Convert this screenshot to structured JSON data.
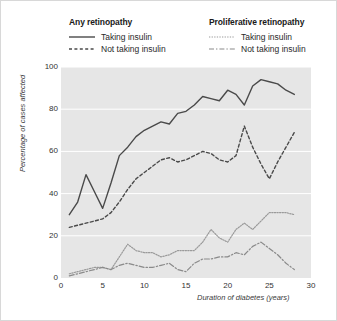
{
  "figure": {
    "background_color": "#ffffff",
    "plot_background_color": "#e6e6e6",
    "grid_color": "#ffffff",
    "border_color": "#d8d8d8"
  },
  "legend": {
    "groups": [
      {
        "title": "Any retinopathy",
        "entries": [
          {
            "label": "Taking insulin",
            "style": "solid",
            "color": "#4a4a4a"
          },
          {
            "label": "Not taking insulin",
            "style": "dashed",
            "color": "#4a4a4a"
          }
        ]
      },
      {
        "title": "Proliferative retinopathy",
        "entries": [
          {
            "label": "Taking insulin",
            "style": "dotted",
            "color": "#9a9a9a"
          },
          {
            "label": "Not taking insulin",
            "style": "dashdot",
            "color": "#8a8a8a"
          }
        ]
      }
    ]
  },
  "chart_data": {
    "type": "line",
    "title": "",
    "xlabel": "Duration of diabetes (years)",
    "ylabel": "Percentage of cases affected",
    "xlim": [
      0,
      30
    ],
    "ylim": [
      0,
      100
    ],
    "xticks": [
      0,
      5,
      10,
      15,
      20,
      25,
      30
    ],
    "yticks": [
      0,
      20,
      40,
      60,
      80,
      100
    ],
    "grid": true,
    "grid_axis": "y",
    "legend_position": "above-plot",
    "x": [
      1,
      2,
      3,
      4,
      5,
      6,
      7,
      8,
      9,
      10,
      11,
      12,
      13,
      14,
      15,
      16,
      17,
      18,
      19,
      20,
      21,
      22,
      23,
      24,
      25,
      26,
      27,
      28
    ],
    "series": [
      {
        "name": "Any retinopathy - Taking insulin",
        "style": "solid",
        "color": "#4a4a4a",
        "width": 1.4,
        "values": [
          30,
          36,
          49,
          41,
          33,
          45,
          58,
          62,
          67,
          70,
          72,
          74,
          73,
          78,
          79,
          82,
          86,
          85,
          84,
          89,
          87,
          82,
          91,
          94,
          93,
          92,
          89,
          87
        ]
      },
      {
        "name": "Any retinopathy - Not taking insulin",
        "style": "dashed",
        "color": "#4a4a4a",
        "width": 1.4,
        "values": [
          24,
          25,
          26,
          27,
          28,
          31,
          36,
          42,
          47,
          50,
          53,
          56,
          57,
          55,
          56,
          58,
          60,
          59,
          56,
          55,
          58,
          72,
          62,
          54,
          47,
          55,
          62,
          69
        ]
      },
      {
        "name": "Proliferative retinopathy - Taking insulin",
        "style": "dotted",
        "color": "#9a9a9a",
        "width": 1.2,
        "values": [
          2,
          3,
          4,
          5,
          5,
          4,
          10,
          16,
          13,
          12,
          12,
          10,
          11,
          13,
          13,
          13,
          17,
          23,
          19,
          17,
          23,
          26,
          23,
          27,
          31,
          31,
          31,
          30
        ]
      },
      {
        "name": "Proliferative retinopathy - Not taking insulin",
        "style": "dashdot",
        "color": "#8a8a8a",
        "width": 1.2,
        "values": [
          1,
          2,
          3,
          4,
          5,
          4,
          6,
          7,
          6,
          5,
          5,
          6,
          7,
          4,
          3,
          7,
          9,
          9,
          10,
          10,
          12,
          11,
          15,
          17,
          14,
          11,
          7,
          4
        ]
      }
    ]
  }
}
